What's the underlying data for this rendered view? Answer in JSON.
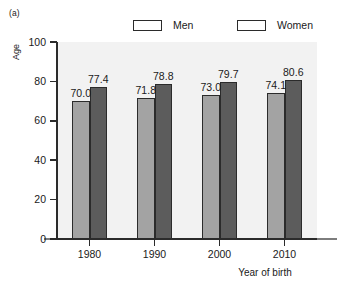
{
  "panel": {
    "tag": "(a)"
  },
  "legend": {
    "position": "top",
    "entries": [
      {
        "label": "Men",
        "color": "#a3a3a3",
        "swatch_name": "legend-swatch-men"
      },
      {
        "label": "Women",
        "color": "#5c5c5c",
        "swatch_name": "legend-swatch-women"
      }
    ]
  },
  "axes": {
    "y": {
      "title": "Age",
      "ticks": [
        "0",
        "20",
        "40",
        "60",
        "80",
        "100"
      ],
      "min": 0,
      "max": 100
    },
    "x": {
      "title": "Year of birth",
      "ticks": [
        "1980",
        "1990",
        "2000",
        "2010"
      ]
    }
  },
  "chart_data": {
    "type": "bar",
    "title": "",
    "subtitle": "",
    "xlabel": "Year of birth",
    "ylabel": "Age",
    "categories": [
      "1980",
      "1990",
      "2000",
      "2010"
    ],
    "series": [
      {
        "name": "Men",
        "color": "#a3a3a3",
        "values": [
          70.0,
          71.8,
          73.0,
          74.1
        ]
      },
      {
        "name": "Women",
        "color": "#5c5c5c",
        "values": [
          77.4,
          78.8,
          79.7,
          80.6
        ]
      }
    ],
    "value_labels": {
      "Men": [
        "70.0",
        "71.8",
        "73.0",
        "74.1"
      ],
      "Women": [
        "77.4",
        "78.8",
        "79.7",
        "80.6"
      ]
    },
    "ylim": [
      0,
      100
    ],
    "yticks": [
      0,
      20,
      40,
      60,
      80,
      100
    ],
    "grid": false,
    "legend_position": "top",
    "plot_background": "#f2f2f2",
    "annotations": [
      "(a)"
    ]
  }
}
